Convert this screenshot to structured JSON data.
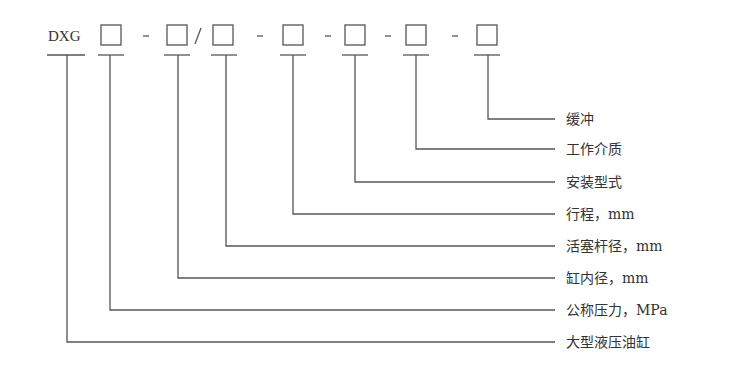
{
  "diagram": {
    "prefix": "DXG",
    "separators": [
      "-",
      "/",
      "-",
      "-",
      "-",
      "-"
    ],
    "fields": [
      {
        "index": 1,
        "label": "公称压力，MPa"
      },
      {
        "index": 2,
        "label": "缸内径，mm"
      },
      {
        "index": 3,
        "label": "活塞杆径，mm"
      },
      {
        "index": 4,
        "label": "行程，mm"
      },
      {
        "index": 5,
        "label": "安装型式"
      },
      {
        "index": 6,
        "label": "工作介质"
      },
      {
        "index": 7,
        "label": "缓冲"
      }
    ],
    "prefix_label": "大型液压油缸",
    "labels_top_to_bottom": [
      "缓冲",
      "工作介质",
      "安装型式",
      "行程，mm",
      "活塞杆径，mm",
      "缸内径，mm",
      "公称压力，MPa",
      "大型液压油缸"
    ],
    "line_color": "#555555"
  }
}
